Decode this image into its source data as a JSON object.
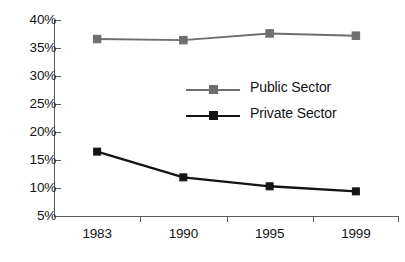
{
  "chart_data": {
    "type": "line",
    "title": "",
    "xlabel": "",
    "ylabel": "",
    "categories": [
      "1983",
      "1990",
      "1995",
      "1999"
    ],
    "ylim": [
      5,
      40
    ],
    "ytick_labels": [
      "40%",
      "35%",
      "30%",
      "25%",
      "20%",
      "15%",
      "10%",
      "5%"
    ],
    "ytick_values": [
      40,
      35,
      30,
      25,
      20,
      15,
      10,
      5
    ],
    "grid": false,
    "legend_position": "center",
    "series": [
      {
        "name": "Public Sector",
        "color": "#6e6e6e",
        "marker": "square",
        "values": [
          36.6,
          36.4,
          37.6,
          37.2
        ]
      },
      {
        "name": "Private Sector",
        "color": "#141414",
        "marker": "square",
        "values": [
          16.5,
          11.9,
          10.3,
          9.4
        ]
      }
    ]
  },
  "legend": {
    "items": [
      {
        "label": "Public Sector"
      },
      {
        "label": "Private Sector"
      }
    ]
  },
  "colors": {
    "public_sector": "#6e6e6e",
    "private_sector": "#141414",
    "axis": "#5a5a5a",
    "text": "#141414",
    "background": "#ffffff"
  }
}
